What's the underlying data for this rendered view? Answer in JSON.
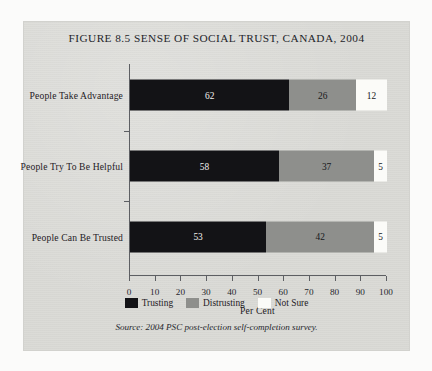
{
  "figure": {
    "title": "FIGURE 8.5 SENSE OF SOCIAL TRUST, CANADA, 2004",
    "source": "Source: 2004 PSC post-election self-completion survey."
  },
  "chart_data": {
    "type": "bar",
    "orientation": "horizontal",
    "stacked": true,
    "title": "FIGURE 8.5 SENSE OF SOCIAL TRUST, CANADA, 2004",
    "xlabel": "Per Cent",
    "ylabel": "",
    "xlim": [
      0,
      100
    ],
    "xticks": [
      0,
      10,
      20,
      30,
      40,
      50,
      60,
      70,
      80,
      90,
      100
    ],
    "xticklabels": [
      "0",
      "10",
      "20",
      "30",
      "40",
      "50",
      "60",
      "70",
      "80",
      "90",
      "100"
    ],
    "grid": false,
    "legend_position": "bottom",
    "categories": [
      "People Take Advantage",
      "People Try To Be Helpful",
      "People Can Be Trusted"
    ],
    "series": [
      {
        "name": "Trusting",
        "color": "#131316",
        "values": [
          62,
          58,
          53
        ]
      },
      {
        "name": "Distrusting",
        "color": "#8e8f8c",
        "values": [
          26,
          37,
          42
        ]
      },
      {
        "name": "Not Sure",
        "color": "#fbfbf8",
        "values": [
          12,
          5,
          5
        ]
      }
    ],
    "annotations": []
  }
}
